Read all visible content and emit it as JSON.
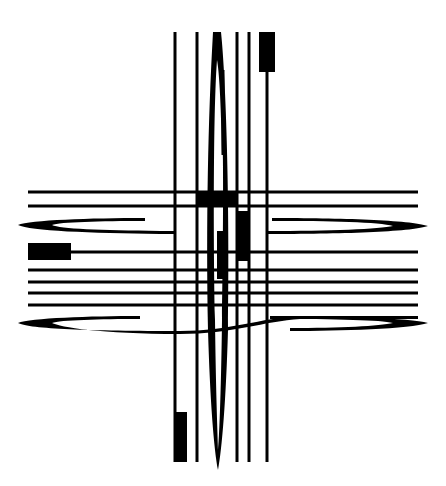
{
  "diagram": {
    "title": "",
    "background": "#ffffff",
    "ink": "#000000",
    "vertical_lines_x": [
      175,
      197,
      237,
      249,
      267
    ],
    "horizontal_lines": [
      {
        "y": 192,
        "x1": 28,
        "x2": 418
      },
      {
        "y": 206,
        "x1": 28,
        "x2": 418
      },
      {
        "y": 252,
        "x1": 70,
        "x2": 418
      },
      {
        "y": 270,
        "x1": 28,
        "x2": 418
      },
      {
        "y": 282,
        "x1": 28,
        "x2": 418
      },
      {
        "y": 305,
        "x1": 28,
        "x2": 418
      }
    ],
    "blocks": [
      {
        "name": "top-right-block",
        "x": 259,
        "y": 32,
        "w": 16,
        "h": 40
      },
      {
        "name": "left-block",
        "x": 28,
        "y": 243,
        "w": 43,
        "h": 17
      },
      {
        "name": "bottom-left-block",
        "x": 174,
        "y": 412,
        "w": 13,
        "h": 50
      },
      {
        "name": "center-horizontal-block",
        "x": 196,
        "y": 191,
        "w": 41,
        "h": 16
      },
      {
        "name": "center-vertical-block-right",
        "x": 237,
        "y": 211,
        "w": 12,
        "h": 50
      },
      {
        "name": "center-vertical-block-left",
        "x": 217,
        "y": 231,
        "w": 8,
        "h": 48
      }
    ]
  }
}
